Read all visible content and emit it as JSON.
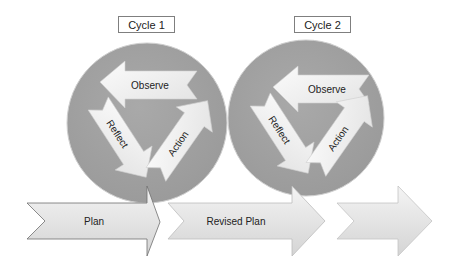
{
  "diagram": {
    "type": "action-research-cycles",
    "cycles": [
      {
        "label": "Cycle 1",
        "steps": [
          "Observe",
          "Reflect",
          "Action"
        ]
      },
      {
        "label": "Cycle 2",
        "steps": [
          "Observe",
          "Reflect",
          "Action"
        ]
      }
    ],
    "timeline": [
      {
        "label": "Plan"
      },
      {
        "label": "Revised Plan"
      },
      {
        "label": ""
      }
    ]
  },
  "colors": {
    "circle": "#a3a3a3",
    "arrow_light": "#f5f5f5",
    "arrow_mid": "#d6d6d6",
    "outline": "#6e6e6e"
  }
}
